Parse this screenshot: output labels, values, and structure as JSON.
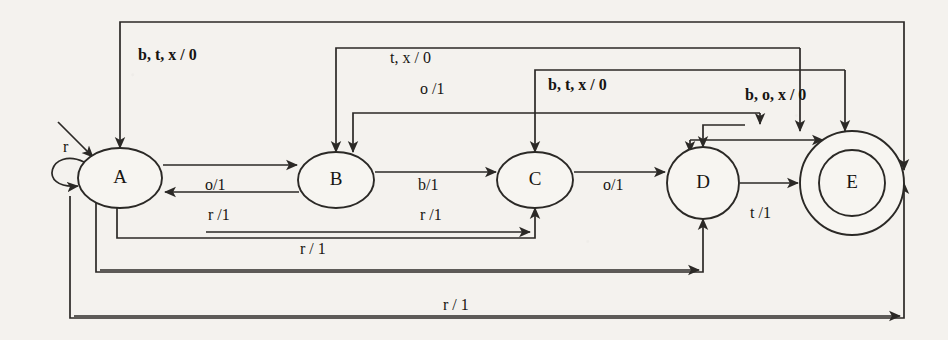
{
  "diagram": {
    "type": "state-machine",
    "notation": "input / output",
    "background_color": "#f4f2ee",
    "ink_color": "#2b2926",
    "states": [
      {
        "id": "A",
        "label": "A",
        "cx": 120,
        "cy": 178,
        "rx": 42,
        "ry": 30,
        "shape": "ellipse",
        "accepting": false,
        "initial": true
      },
      {
        "id": "B",
        "label": "B",
        "cx": 336,
        "cy": 180,
        "rx": 38,
        "ry": 28,
        "shape": "ellipse",
        "accepting": false,
        "initial": false
      },
      {
        "id": "C",
        "label": "C",
        "cx": 535,
        "cy": 180,
        "rx": 38,
        "ry": 28,
        "shape": "ellipse",
        "accepting": false,
        "initial": false
      },
      {
        "id": "D",
        "label": "D",
        "cx": 703,
        "cy": 183,
        "rx": 36,
        "ry": 36,
        "shape": "circle",
        "accepting": false,
        "initial": false
      },
      {
        "id": "E",
        "label": "E",
        "cx": 852,
        "cy": 183,
        "rx": 52,
        "ry": 52,
        "shape": "double-circle",
        "accepting": true,
        "initial": false
      }
    ],
    "edge_labels": {
      "start_arrow": "",
      "self_loop_a": "r",
      "a_to_b": "o/1",
      "b_to_a": "r /1",
      "b_to_c": "b/1",
      "c_to_d": "o/1",
      "d_to_e": "t /1",
      "e_self": "b, o, x / 0",
      "b_t_x_0_to_a": "b, t, x / 0",
      "t_x_0_to_b": "t, x / 0",
      "o_1_to_b": "o /1",
      "b_t_x_0_to_c": "b, t, x / 0",
      "r_1_to_c": "r /1",
      "r_1_to_d": "r / 1",
      "r_1_bottom": "r / 1"
    },
    "transitions": [
      {
        "from": "A",
        "to": "A",
        "input": "r",
        "output": "",
        "label": "r"
      },
      {
        "from": "A",
        "to": "B",
        "input": "o",
        "output": "1",
        "label": "o/1"
      },
      {
        "from": "B",
        "to": "A",
        "input": "r",
        "output": "1",
        "label": "r /1"
      },
      {
        "from": "B",
        "to": "C",
        "input": "b",
        "output": "1",
        "label": "b/1"
      },
      {
        "from": "C",
        "to": "D",
        "input": "o",
        "output": "1",
        "label": "o/1"
      },
      {
        "from": "D",
        "to": "E",
        "input": "t",
        "output": "1",
        "label": "t /1"
      },
      {
        "from": "E",
        "to": "E",
        "input": "b, o, x",
        "output": "0",
        "label": "b, o, x / 0"
      },
      {
        "from": "B",
        "to": "A",
        "input": "b, t, x",
        "output": "0",
        "label": "b, t, x / 0"
      },
      {
        "from": "C",
        "to": "B",
        "input": "t, x",
        "output": "0",
        "label": "t, x / 0"
      },
      {
        "from": "C",
        "to": "B",
        "input": "o",
        "output": "1",
        "label": "o /1"
      },
      {
        "from": "D",
        "to": "C",
        "input": "b, t, x",
        "output": "0",
        "label": "b, t, x / 0"
      },
      {
        "from": "C",
        "to": "A",
        "input": "r",
        "output": "1",
        "label": "r /1"
      },
      {
        "from": "D",
        "to": "A",
        "input": "r",
        "output": "1",
        "label": "r / 1"
      },
      {
        "from": "E",
        "to": "A",
        "input": "r",
        "output": "1",
        "label": "r / 1"
      }
    ]
  }
}
